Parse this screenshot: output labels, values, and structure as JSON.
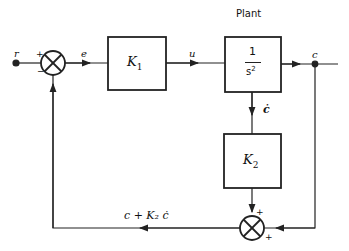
{
  "diagram": {
    "title_plant": "Plant",
    "signals": {
      "r": "r",
      "e": "e",
      "u": "u",
      "c": "c",
      "c_dot": "ċ",
      "feedback": "c + K₂ ċ"
    },
    "blocks": {
      "controller": {
        "main": "K",
        "sub": "1"
      },
      "plant": {
        "numerator": "1",
        "denominator": "s",
        "exponent": "2"
      },
      "rate_gain": {
        "main": "K",
        "sub": "2"
      }
    },
    "junctions": {
      "input_sum": {
        "top_sign": "+",
        "bottom_sign": "−"
      },
      "feedback_sum": {
        "top_sign": "+",
        "right_sign": "+"
      }
    },
    "colors": {
      "line": "#222222",
      "background": "#ffffff"
    }
  }
}
